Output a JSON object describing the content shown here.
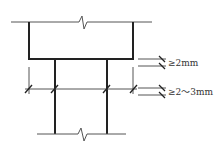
{
  "diagram": {
    "dimensions": [
      {
        "id": "upper-gap",
        "label": "≥2mm"
      },
      {
        "id": "lower-gap",
        "label": "≥2～3mm"
      }
    ],
    "colors": {
      "line": "#222222",
      "thin_line": "#555555",
      "text": "#333333",
      "background": "#ffffff"
    }
  }
}
